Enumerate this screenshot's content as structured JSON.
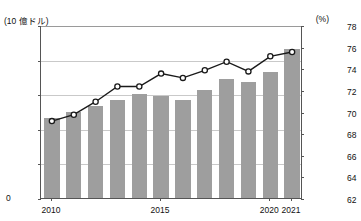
{
  "chart_data": {
    "type": "bar",
    "title": "",
    "xlabel": "",
    "ylabel": "(10 億ドル)",
    "y2label": "(%)",
    "grid": true,
    "legend": "none",
    "categories": [
      "2010",
      "2011",
      "2012",
      "2013",
      "2014",
      "2015",
      "2016",
      "2017",
      "2018",
      "2019",
      "2020",
      "2021"
    ],
    "xtick_labels": [
      "2010",
      "2015",
      "2020",
      "2021"
    ],
    "xtick_positions": [
      0,
      5,
      10,
      11
    ],
    "ylim": [
      0,
      2500
    ],
    "yticks": [
      0,
      500,
      1000,
      1500,
      2000,
      2500
    ],
    "ytick_labels": [
      "0",
      "500",
      "1,000",
      "1,500",
      "2,000",
      "2,500"
    ],
    "y2lim": [
      62,
      78
    ],
    "y2ticks": [
      62,
      64,
      66,
      68,
      70,
      72,
      74,
      76,
      78
    ],
    "y2tick_labels": [
      "62",
      "64",
      "66",
      "68",
      "70",
      "72",
      "74",
      "76",
      "78"
    ],
    "series": [
      {
        "name": "金額",
        "type": "bar",
        "axis": "left",
        "color": "#9e9e9e",
        "values": [
          1150,
          1250,
          1330,
          1420,
          1500,
          1470,
          1420,
          1560,
          1720,
          1670,
          1820,
          2150
        ]
      },
      {
        "name": "割合",
        "type": "line",
        "axis": "right",
        "color": "#1a1a1a",
        "marker": "circle-open",
        "values": [
          69.2,
          69.8,
          71.0,
          72.4,
          72.4,
          73.6,
          73.2,
          73.9,
          74.7,
          73.8,
          75.2,
          75.6
        ]
      }
    ]
  },
  "axes": {
    "left_unit": "(10 億ドル)",
    "right_unit": "(%)",
    "zero_label": "0"
  }
}
